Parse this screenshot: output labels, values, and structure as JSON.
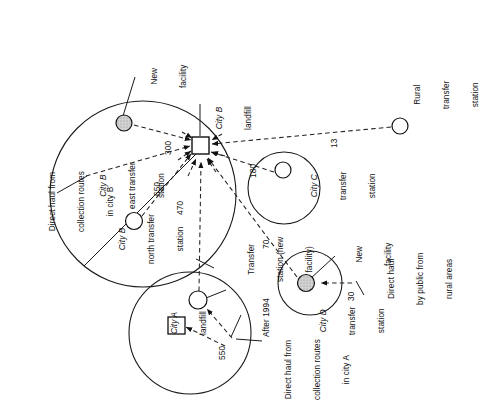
{
  "diagram": {
    "regions": [
      {
        "id": "city-b",
        "label_line1": "City B",
        "label_line2": "east transfer",
        "label_line3": "station"
      },
      {
        "id": "city-b-north",
        "label_line1": "City B",
        "label_line2": "north transfer",
        "label_line3": "station"
      },
      {
        "id": "city-c",
        "label_line1": "City C",
        "label_line2": "transfer",
        "label_line3": "station"
      },
      {
        "id": "city-d",
        "label_line1": "City D",
        "label_line2": "transfer",
        "label_line3": "station"
      },
      {
        "id": "city-a",
        "label_line1": "City A",
        "label_line2": "landfill"
      }
    ],
    "nodes": {
      "city_b_landfill": {
        "label_line1": "City B",
        "label_line2": "landfill",
        "shape": "square"
      },
      "city_b_east_new_facility": {
        "label_line1": "New",
        "label_line2": "facility",
        "shape": "circle-shaded"
      },
      "city_b_north_station": {
        "shape": "circle"
      },
      "city_c_station": {
        "shape": "circle"
      },
      "city_d_new_facility": {
        "label_line1": "New",
        "label_line2": "facility",
        "shape": "circle-shaded"
      },
      "rural_station": {
        "label_line1": "Rural",
        "label_line2": "transfer",
        "label_line3": "station",
        "shape": "circle"
      },
      "city_a_landfill": {
        "label_line1": "City A",
        "label_line2": "landfill",
        "shape": "square"
      },
      "city_a_transfer_station": {
        "label_line1": "Transfer",
        "label_line2": "station (new",
        "label_line3": "facility)",
        "shape": "circle"
      }
    },
    "flow_values": {
      "city_b_east_to_landfill": "300",
      "city_b_direct_to_landfill": "650",
      "city_b_north_to_landfill": "470",
      "city_c_to_landfill": "180",
      "rural_to_landfill": "13",
      "city_d_to_landfill": "70",
      "rural_public_to_city_d": "30",
      "city_a_to_city_a_landfill": "550"
    },
    "annotations": {
      "direct_haul_city_b": {
        "line1": "Direct haul from",
        "line2": "collection routes",
        "line3": "in city B"
      },
      "direct_haul_city_a": {
        "line1": "Direct haul from",
        "line2": "collection routes",
        "line3": "in city A"
      },
      "direct_haul_rural": {
        "line1": "Direct haul",
        "line2": "by public from",
        "line3": "rural areas"
      },
      "after_1994": {
        "line1": "After 1994"
      }
    },
    "colors": {
      "stroke": "#1a1a1a",
      "shaded_fill": "#c9c9c9",
      "plain_fill": "#ffffff",
      "background": "#ffffff"
    }
  }
}
